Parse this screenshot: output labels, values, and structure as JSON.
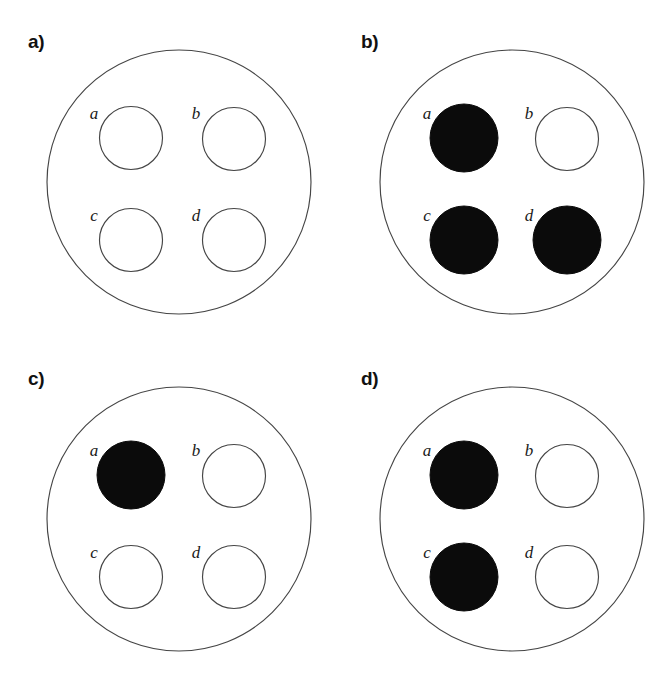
{
  "figure": {
    "type": "diagram",
    "background_color": "#ffffff",
    "stroke_color": "#454545",
    "fill_color": "#0b0b0b",
    "empty_color": "#ffffff",
    "geometry": {
      "outer_circle": {
        "cx": 179,
        "cy": 182,
        "r": 132
      },
      "inner_radius_empty": 31.5,
      "inner_radius_filled": 34,
      "inner_positions": [
        {
          "key": "a",
          "cx": 131,
          "cy": 138,
          "label_x": 94,
          "label_y": 115
        },
        {
          "key": "b",
          "cx": 234,
          "cy": 139,
          "label_x": 196,
          "label_y": 115
        },
        {
          "key": "c",
          "cx": 131,
          "cy": 240,
          "label_x": 94,
          "label_y": 217
        },
        {
          "key": "d",
          "cx": 234,
          "cy": 240,
          "label_x": 196,
          "label_y": 217
        }
      ]
    },
    "panels": [
      {
        "id": "panel-a",
        "label": "a)",
        "origin": {
          "x": 0,
          "y": 0
        },
        "items": [
          {
            "key": "a",
            "label": "a",
            "filled": false
          },
          {
            "key": "b",
            "label": "b",
            "filled": false
          },
          {
            "key": "c",
            "label": "c",
            "filled": false
          },
          {
            "key": "d",
            "label": "d",
            "filled": false
          }
        ],
        "filled_keys": [],
        "filled_count": 0
      },
      {
        "id": "panel-b",
        "label": "b)",
        "origin": {
          "x": 333,
          "y": 0
        },
        "items": [
          {
            "key": "a",
            "label": "a",
            "filled": true
          },
          {
            "key": "b",
            "label": "b",
            "filled": false
          },
          {
            "key": "c",
            "label": "c",
            "filled": true
          },
          {
            "key": "d",
            "label": "d",
            "filled": true
          }
        ],
        "filled_keys": [
          "a",
          "c",
          "d"
        ],
        "filled_count": 3
      },
      {
        "id": "panel-c",
        "label": "c)",
        "origin": {
          "x": 0,
          "y": 337
        },
        "items": [
          {
            "key": "a",
            "label": "a",
            "filled": true
          },
          {
            "key": "b",
            "label": "b",
            "filled": false
          },
          {
            "key": "c",
            "label": "c",
            "filled": false
          },
          {
            "key": "d",
            "label": "d",
            "filled": false
          }
        ],
        "filled_keys": [
          "a"
        ],
        "filled_count": 1
      },
      {
        "id": "panel-d",
        "label": "d)",
        "origin": {
          "x": 333,
          "y": 337
        },
        "items": [
          {
            "key": "a",
            "label": "a",
            "filled": true
          },
          {
            "key": "b",
            "label": "b",
            "filled": false
          },
          {
            "key": "c",
            "label": "c",
            "filled": true
          },
          {
            "key": "d",
            "label": "d",
            "filled": false
          }
        ],
        "filled_keys": [
          "a",
          "c"
        ],
        "filled_count": 2
      }
    ]
  }
}
